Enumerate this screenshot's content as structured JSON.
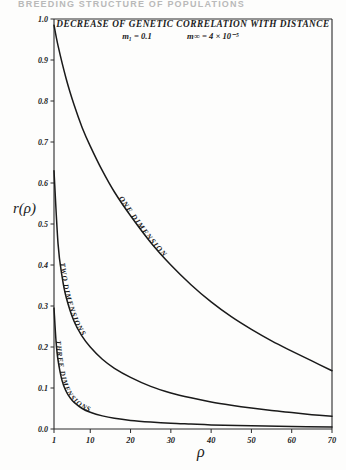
{
  "running_head": "BREEDING STRUCTURE OF POPULATIONS",
  "figure": {
    "title": "DECREASE OF GENETIC CORRELATION WITH DISTANCE",
    "subtitle_m1": "m₁ = 0.1",
    "subtitle_minf": "m∞ = 4 × 10⁻⁵"
  },
  "chart_data": {
    "type": "line",
    "title": "DECREASE OF GENETIC CORRELATION WITH DISTANCE",
    "subtitle": "m₁ = 0.1    m∞ = 4 × 10⁻⁵",
    "xlabel": "ρ",
    "ylabel": "r(ρ)",
    "xlim": [
      1,
      70
    ],
    "ylim": [
      0.0,
      1.0
    ],
    "grid": false,
    "legend": "inline-curve-labels",
    "xticks": [
      1,
      10,
      20,
      30,
      40,
      50,
      60,
      70
    ],
    "xtick_labels": [
      "1",
      "10",
      "20",
      "30",
      "40",
      "50",
      "60",
      "70"
    ],
    "yticks": [
      0.0,
      0.1,
      0.2,
      0.3,
      0.4,
      0.5,
      0.6,
      0.7,
      0.8,
      0.9,
      1.0
    ],
    "ytick_labels": [
      "0.0",
      "0.1",
      "0.2",
      "0.3",
      "0.4",
      "0.5",
      "0.6",
      "0.7",
      "0.8",
      "0.9",
      "1.0"
    ],
    "series": [
      {
        "name": "ONE DIMENSION",
        "label": "ONE DIMENSION",
        "x": [
          1,
          2,
          4,
          6,
          8,
          10,
          13,
          16,
          20,
          25,
          30,
          35,
          40,
          45,
          50,
          55,
          60,
          65,
          70
        ],
        "values": [
          0.985,
          0.935,
          0.855,
          0.79,
          0.735,
          0.69,
          0.63,
          0.578,
          0.52,
          0.455,
          0.4,
          0.352,
          0.31,
          0.274,
          0.243,
          0.215,
          0.19,
          0.166,
          0.142
        ]
      },
      {
        "name": "TWO DIMENSIONS",
        "label": "TWO DIMENSIONS",
        "x": [
          1,
          2,
          3,
          4,
          6,
          8,
          10,
          13,
          16,
          20,
          25,
          30,
          35,
          40,
          45,
          50,
          55,
          60,
          65,
          70
        ],
        "values": [
          0.63,
          0.452,
          0.372,
          0.322,
          0.262,
          0.226,
          0.2,
          0.17,
          0.148,
          0.126,
          0.104,
          0.088,
          0.076,
          0.066,
          0.058,
          0.051,
          0.045,
          0.04,
          0.035,
          0.031
        ]
      },
      {
        "name": "THREE DIMENSIONS",
        "label": "THREE DIMENSIONS",
        "x": [
          1,
          1.5,
          2,
          3,
          4,
          5,
          6,
          8,
          10,
          13,
          16,
          20,
          25,
          30,
          35,
          40,
          50,
          60,
          70
        ],
        "values": [
          0.295,
          0.215,
          0.168,
          0.118,
          0.092,
          0.076,
          0.065,
          0.05,
          0.041,
          0.032,
          0.026,
          0.021,
          0.017,
          0.014,
          0.012,
          0.01,
          0.008,
          0.006,
          0.005
        ]
      }
    ]
  }
}
